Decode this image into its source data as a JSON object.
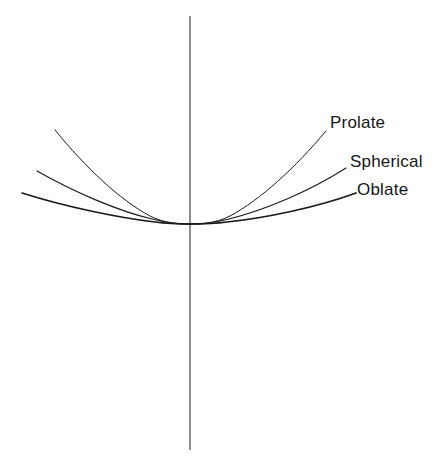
{
  "figure": {
    "background_color": "#ffffff",
    "line_color": "#1a1a1a",
    "axis_color": "#3a3a3a",
    "labels": {
      "prolate": "Prolate",
      "spherical": "Spherical",
      "oblate": "Oblate"
    }
  },
  "chart_data": {
    "type": "line",
    "title": "",
    "subtitle": "",
    "xlabel": "",
    "ylabel": "",
    "grid": false,
    "legend_position": "inline-right-end-of-curve",
    "axes": {
      "vertical_axis_x_px": 190,
      "vertical_axis_top_px": 16,
      "vertical_axis_bottom_px": 450,
      "origin_px": [
        190,
        224
      ],
      "horizontal_axis_shown": false,
      "tick_labels": [],
      "xlim": [
        -190,
        257
      ],
      "ylim": [
        0,
        120
      ]
    },
    "x": [
      -168,
      -140,
      -120,
      -100,
      -80,
      -60,
      -40,
      -20,
      0,
      20,
      40,
      60,
      80,
      100,
      120,
      140,
      165
    ],
    "series": [
      {
        "name": "Prolate",
        "label": "Prolate",
        "curvature": "highest",
        "stroke_width": 1.0,
        "endpoint_left_px": [
          55,
          130
        ],
        "endpoint_right_px": [
          326,
          131
        ],
        "vertex_px": [
          190,
          224
        ],
        "values": [
          94,
          66,
          48,
          35,
          23,
          13,
          6,
          1.5,
          0,
          1.5,
          6,
          13,
          23,
          35,
          48,
          66,
          93
        ]
      },
      {
        "name": "Spherical",
        "label": "Spherical",
        "curvature": "medium",
        "stroke_width": 1.1,
        "endpoint_left_px": [
          37,
          171
        ],
        "endpoint_right_px": [
          346,
          168
        ],
        "vertex_px": [
          190,
          224
        ],
        "values": [
          53,
          38,
          28,
          20,
          13,
          7.5,
          3.4,
          0.9,
          0,
          0.9,
          3.4,
          7.5,
          13,
          20,
          28,
          38,
          56
        ]
      },
      {
        "name": "Oblate",
        "label": "Oblate",
        "curvature": "lowest",
        "stroke_width": 1.7,
        "endpoint_left_px": [
          22,
          193
        ],
        "endpoint_right_px": [
          356,
          193
        ],
        "vertex_px": [
          190,
          224
        ],
        "values": [
          31,
          22,
          16,
          11.5,
          7.5,
          4.2,
          1.9,
          0.5,
          0,
          0.5,
          1.9,
          4.2,
          7.5,
          11.5,
          16,
          22,
          31
        ]
      }
    ],
    "label_positions_px": {
      "prolate": [
        330,
        128
      ],
      "spherical": [
        350,
        167
      ],
      "oblate": [
        357,
        195
      ]
    }
  }
}
